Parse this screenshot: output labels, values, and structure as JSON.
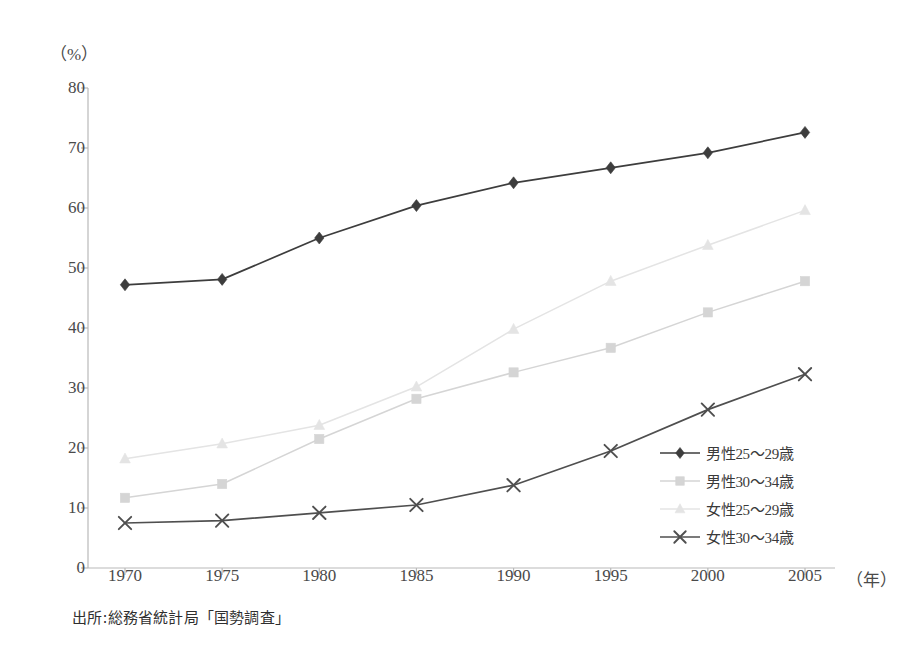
{
  "chart_data": {
    "type": "line",
    "title": "",
    "xlabel": "年",
    "ylabel": "%",
    "unit_label": "（%）",
    "x_unit_label": "（年）",
    "categories": [
      "1970",
      "1975",
      "1980",
      "1985",
      "1990",
      "1995",
      "2000",
      "2005"
    ],
    "x": [
      1970,
      1975,
      1980,
      1985,
      1990,
      1995,
      2000,
      2005
    ],
    "ylim": [
      0,
      80
    ],
    "ytick_labels": [
      "0",
      "10",
      "20",
      "30",
      "40",
      "50",
      "60",
      "70",
      "80"
    ],
    "ytick_values": [
      0,
      10,
      20,
      30,
      40,
      50,
      60,
      70,
      80
    ],
    "grid": false,
    "legend_position": "right-inside-lower",
    "series": [
      {
        "name": "男性25～29歳",
        "marker": "diamond",
        "color": "#3d3d3d",
        "values": [
          47.2,
          48.1,
          55.0,
          60.4,
          64.2,
          66.7,
          69.2,
          72.6
        ]
      },
      {
        "name": "男性30～34歳",
        "marker": "square",
        "color": "#d5d5d5",
        "values": [
          11.7,
          14.0,
          21.5,
          28.2,
          32.6,
          36.7,
          42.6,
          47.8
        ]
      },
      {
        "name": "女性25～29歳",
        "marker": "triangle",
        "color": "#e4e4e4",
        "values": [
          18.2,
          20.7,
          23.8,
          30.2,
          39.8,
          47.8,
          53.8,
          59.6
        ]
      },
      {
        "name": "女性30～34歳",
        "marker": "cross",
        "color": "#4f4f4f",
        "values": [
          7.5,
          7.9,
          9.2,
          10.5,
          13.8,
          19.5,
          26.4,
          32.3
        ]
      }
    ],
    "source_note": "出所:総務省統計局「国勢調査」"
  }
}
